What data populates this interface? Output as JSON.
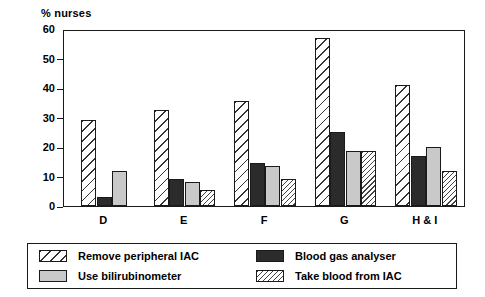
{
  "chart_data": {
    "type": "bar",
    "title": "",
    "ylabel": "% nurses",
    "xlabel": "",
    "ylim": [
      0,
      60
    ],
    "yticks": [
      0,
      10,
      20,
      30,
      40,
      50,
      60
    ],
    "grid": false,
    "legend_position": "bottom",
    "categories": [
      "D",
      "E",
      "F",
      "G",
      "H & I"
    ],
    "series": [
      {
        "name": "Remove peripheral IAC",
        "pattern": "diagonal-hatch-wide",
        "color": "#ffffff",
        "values": [
          29,
          32.5,
          35.5,
          57,
          41
        ]
      },
      {
        "name": "Blood gas analyser",
        "pattern": "solid-dark",
        "color": "#2b2b2b",
        "values": [
          3,
          9,
          14.5,
          25,
          17
        ]
      },
      {
        "name": "Use bilirubinometer",
        "pattern": "solid-light-grey",
        "color": "#c9c9c9",
        "values": [
          12,
          8,
          13.5,
          18.5,
          20
        ]
      },
      {
        "name": "Take blood from IAC",
        "pattern": "diagonal-hatch-fine",
        "color": "#ffffff",
        "values": [
          null,
          5.5,
          9,
          18.5,
          12
        ]
      }
    ]
  },
  "axis": {
    "y_title": "% nurses",
    "y_tick_labels": [
      "60",
      "50",
      "40",
      "30",
      "20",
      "10",
      "0"
    ],
    "x_tick_labels": [
      "D",
      "E",
      "F",
      "G",
      "H & I"
    ]
  },
  "legend": {
    "items": [
      {
        "label": "Remove peripheral IAC",
        "swatch": "hatch-wide-swatch"
      },
      {
        "label": "Blood gas analyser",
        "swatch": "solid-dark-swatch"
      },
      {
        "label": "Use bilirubinometer",
        "swatch": "solid-light-swatch"
      },
      {
        "label": "Take blood from IAC",
        "swatch": "hatch-fine-swatch"
      }
    ]
  }
}
